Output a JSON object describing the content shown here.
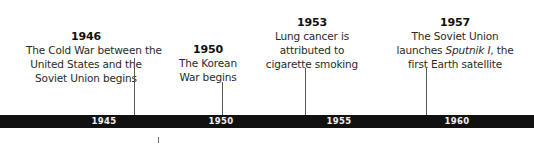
{
  "timeline": {
    "bar_color": "#111111",
    "tick_labels": [
      "1945",
      "1950",
      "1955",
      "1960"
    ],
    "events": [
      {
        "year": "1946",
        "lines": [
          "The Cold War between the",
          "United States and the",
          "Soviet Union begins"
        ]
      },
      {
        "year": "1950",
        "lines": [
          "The Korean",
          "War begins"
        ]
      },
      {
        "year": "1953",
        "lines": [
          "Lung cancer is",
          "attributed to",
          "cigarette smoking"
        ]
      },
      {
        "year": "1957",
        "lines": [
          "The Soviet Union"
        ],
        "line2_prefix": "launches ",
        "line2_italic": "Sputnik I",
        "line2_suffix": ", the",
        "line3": "first Earth satellite"
      }
    ]
  }
}
